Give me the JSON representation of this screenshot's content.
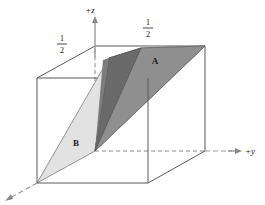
{
  "figure": {
    "axes": {
      "z_label": "+z",
      "y_label": "+y",
      "x_label": ""
    },
    "tick_labels": [
      {
        "id": "left-half",
        "numerator": "1",
        "denominator": "2"
      },
      {
        "id": "right-half",
        "numerator": "1",
        "denominator": "2"
      }
    ],
    "regions": [
      {
        "id": "A",
        "label": "A",
        "fill": "#9a9a9a"
      },
      {
        "id": "B",
        "label": "B",
        "fill": "#e2e2e2"
      },
      {
        "id": "overlap",
        "label": "",
        "fill": "#6a6a6a"
      }
    ],
    "colors": {
      "edge": "#4a4a4a",
      "dashed": "#8a8a8a",
      "plane_a": "#9a9a9a",
      "plane_b": "#e2e2e2",
      "plane_overlap": "#6a6a6a",
      "plane_top_a": "#8f8f8f",
      "background": "#ffffff",
      "text": "#1a1a1a"
    },
    "geometry": {
      "front_top_left": "37,78",
      "front_top_right": "148,78",
      "front_bottom_left": "37,183",
      "front_bottom_right": "148,183",
      "back_top_left": "95,46",
      "back_top_right": "205,46",
      "back_bottom_left": "95,151",
      "back_bottom_right": "205,151",
      "center_apex": "95,151"
    }
  }
}
